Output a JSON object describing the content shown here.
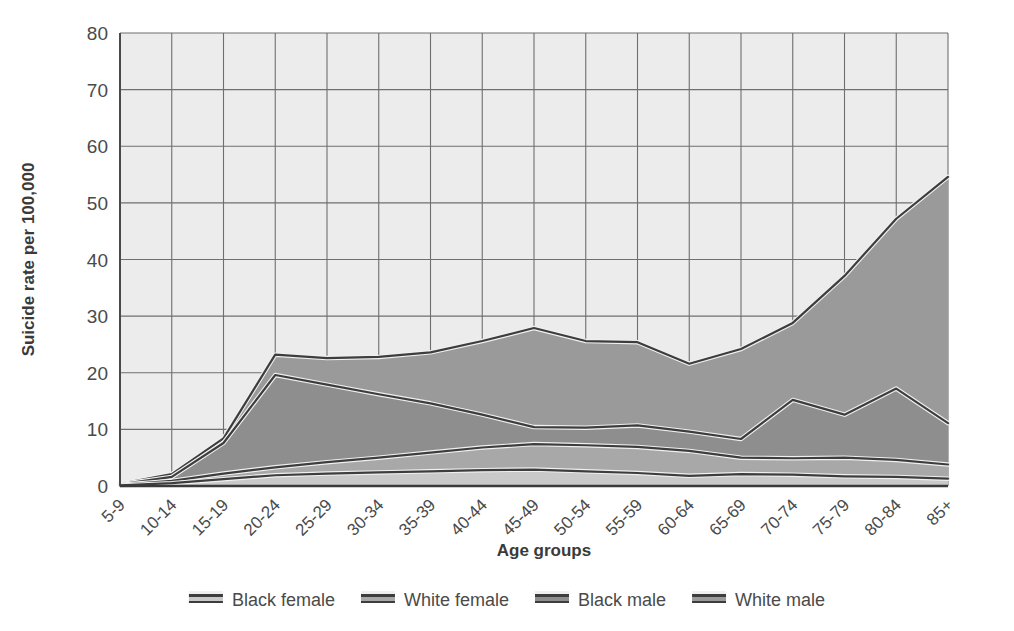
{
  "chart_data": {
    "type": "area",
    "title": "",
    "subtitle": "",
    "xlabel": "Age groups",
    "ylabel": "Suicide rate per 100,000",
    "xlim": [
      0,
      16
    ],
    "ylim": [
      0,
      80
    ],
    "yticks": [
      0,
      10,
      20,
      30,
      40,
      50,
      60,
      70,
      80
    ],
    "grid": true,
    "legend_position": "bottom",
    "categories": [
      "5-9",
      "10-14",
      "15-19",
      "20-24",
      "25-29",
      "30-34",
      "35-39",
      "40-44",
      "45-49",
      "50-54",
      "55-59",
      "60-64",
      "65-69",
      "70-74",
      "75-79",
      "80-84",
      "85+"
    ],
    "series": [
      {
        "name": "Black female",
        "color": "#c9c9c9",
        "values": [
          0.1,
          0.5,
          1.2,
          1.9,
          2.2,
          2.4,
          2.6,
          2.8,
          2.9,
          2.6,
          2.3,
          1.8,
          2.1,
          2.0,
          1.7,
          1.6,
          1.3
        ]
      },
      {
        "name": "White female",
        "color": "#a8a8a8",
        "values": [
          0.2,
          0.9,
          2.2,
          3.3,
          4.2,
          5.0,
          5.9,
          6.8,
          7.4,
          7.2,
          6.9,
          6.2,
          5.0,
          4.9,
          5.0,
          4.6,
          3.8
        ]
      },
      {
        "name": "Black male",
        "color": "#8e8e8e",
        "values": [
          0.3,
          1.6,
          7.6,
          19.6,
          17.9,
          16.2,
          14.6,
          12.6,
          10.4,
          10.3,
          10.7,
          9.6,
          8.3,
          15.2,
          12.6,
          17.2,
          11.1
        ]
      },
      {
        "name": "White male",
        "color": "#9a9a9a",
        "values": [
          0.4,
          2.1,
          8.4,
          23.2,
          22.6,
          22.8,
          23.6,
          25.6,
          27.9,
          25.6,
          25.4,
          21.6,
          24.2,
          28.8,
          37.1,
          47.2,
          54.6
        ]
      }
    ]
  }
}
